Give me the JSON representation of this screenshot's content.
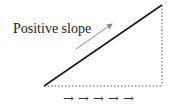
{
  "diagram": {
    "label": "Positive slope",
    "arrows": "→ → → → →",
    "colors": {
      "line": "#1a1a1a",
      "dotted": "#555555",
      "pointer_arrow": "#888888"
    }
  }
}
